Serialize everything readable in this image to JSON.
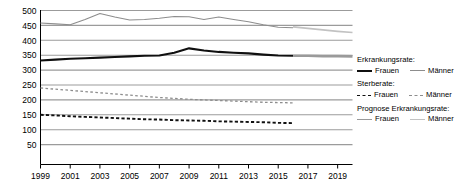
{
  "chart_data": {
    "type": "line",
    "title": "",
    "xlabel": "",
    "ylabel": "",
    "xlim": [
      1999,
      2020
    ],
    "ylim": [
      0,
      500
    ],
    "y_ticks": [
      50,
      100,
      150,
      200,
      250,
      300,
      350,
      400,
      450,
      500
    ],
    "x_ticks": [
      1999,
      2001,
      2003,
      2005,
      2007,
      2009,
      2011,
      2013,
      2015,
      2017,
      2019
    ],
    "x_tick_labels": [
      "1999",
      "2001",
      "2003",
      "2005",
      "2007",
      "2009",
      "2011",
      "2013",
      "2015",
      "2017",
      "2019"
    ],
    "y_tick_labels": [
      "50",
      "100",
      "150",
      "200",
      "250",
      "300",
      "350",
      "400",
      "450",
      "500"
    ],
    "grid": true,
    "legend_position": "right",
    "x": [
      1999,
      2000,
      2001,
      2002,
      2003,
      2004,
      2005,
      2006,
      2007,
      2008,
      2009,
      2010,
      2011,
      2012,
      2013,
      2014,
      2015,
      2016
    ],
    "x_forecast": [
      2016,
      2017,
      2018,
      2019,
      2020
    ],
    "series": [
      {
        "name": "Erkrankungsrate Frauen",
        "group": "Erkrankungsrate",
        "sex": "Frauen",
        "style": "solid",
        "color": "#101010",
        "width": 2.1,
        "values": [
          332,
          335,
          338,
          340,
          342,
          344,
          346,
          348,
          349,
          358,
          373,
          366,
          361,
          358,
          356,
          352,
          349,
          348
        ]
      },
      {
        "name": "Erkrankungsrate Männer",
        "group": "Erkrankungsrate",
        "sex": "Männer",
        "style": "solid",
        "color": "#8d8d8d",
        "width": 1.1,
        "values": [
          458,
          455,
          452,
          470,
          490,
          478,
          468,
          470,
          474,
          480,
          479,
          470,
          478,
          470,
          462,
          452,
          444,
          442
        ]
      },
      {
        "name": "Sterberate Frauen",
        "group": "Sterberate",
        "sex": "Frauen",
        "style": "dashed",
        "color": "#101010",
        "width": 1.9,
        "values": [
          150,
          148,
          145,
          143,
          141,
          139,
          137,
          135,
          134,
          132,
          131,
          130,
          128,
          127,
          126,
          125,
          123,
          122
        ]
      },
      {
        "name": "Sterberate Männer",
        "group": "Sterberate",
        "sex": "Männer",
        "style": "dashed",
        "color": "#8d8d8d",
        "width": 1.3,
        "values": [
          240,
          236,
          232,
          228,
          224,
          220,
          216,
          212,
          208,
          205,
          202,
          200,
          198,
          196,
          194,
          192,
          191,
          190
        ]
      }
    ],
    "forecast_series": [
      {
        "name": "Prognose Erkrankungsrate Frauen",
        "group": "Prognose Erkrankungsrate",
        "sex": "Frauen",
        "style": "solid",
        "color": "#9a9a9a",
        "width": 2.6,
        "values": [
          348,
          348,
          347,
          347,
          346
        ]
      },
      {
        "name": "Prognose Erkrankungsrate Männer",
        "group": "Prognose Erkrankungsrate",
        "sex": "Männer",
        "style": "solid",
        "color": "#c2c2c2",
        "width": 1.6,
        "values": [
          445,
          440,
          435,
          430,
          426
        ]
      }
    ]
  },
  "legend": {
    "groups": [
      {
        "title": "Erkrankungsrate:",
        "entries": [
          {
            "label": "Frauen",
            "swatch": "sw-solid-thick"
          },
          {
            "label": "Männer",
            "swatch": "sw-solid-thin"
          }
        ]
      },
      {
        "title": "Sterberate:",
        "entries": [
          {
            "label": "Frauen",
            "swatch": "sw-dash-black"
          },
          {
            "label": "Männer",
            "swatch": "sw-dash-gray"
          }
        ]
      },
      {
        "title": "Prognose Erkrankungsrate:",
        "entries": [
          {
            "label": "Frauen",
            "swatch": "sw-prog-f"
          },
          {
            "label": "Männer",
            "swatch": "sw-prog-m"
          }
        ]
      }
    ]
  },
  "colors": {
    "axis": "#000000",
    "grid": "#9b9b9b",
    "black_series": "#101010",
    "gray_series": "#8d8d8d",
    "forecast_frauen": "#9a9a9a",
    "forecast_maenner": "#c2c2c2",
    "background": "#ffffff"
  }
}
